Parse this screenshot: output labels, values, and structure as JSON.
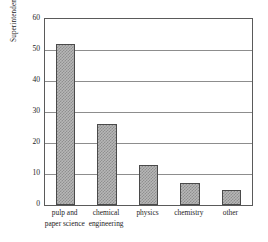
{
  "chart_data": {
    "type": "bar",
    "title": "",
    "subtitle": "",
    "xlabel": "",
    "ylabel": "Superintendents",
    "categories": [
      "pulp and paper science",
      "chemical engineering",
      "physics",
      "chemistry",
      "other"
    ],
    "category_lines": [
      [
        "pulp and",
        "paper science"
      ],
      [
        "chemical",
        "engineering"
      ],
      [
        "physics",
        ""
      ],
      [
        "chemistry",
        ""
      ],
      [
        "other",
        ""
      ]
    ],
    "values": [
      52,
      26,
      13,
      7,
      5
    ],
    "ylim": [
      0,
      60
    ],
    "yticks": [
      0,
      10,
      20,
      30,
      40,
      50,
      60
    ],
    "ytick_labels": [
      "0",
      "10",
      "20",
      "30",
      "40",
      "50",
      "60"
    ],
    "grid": true,
    "grid_axis": "y",
    "legend": false,
    "legend_position": "none",
    "bar_fill_color": "#b7b7b7",
    "bar_pattern_color": "#8f8f8f",
    "bar_edge_color": "#4a4a4a",
    "axis_color": "#5a5a5a",
    "gridline_color": "#8d8d8d",
    "background_color": "#ffffff",
    "text_color": "#1d1d1d"
  }
}
